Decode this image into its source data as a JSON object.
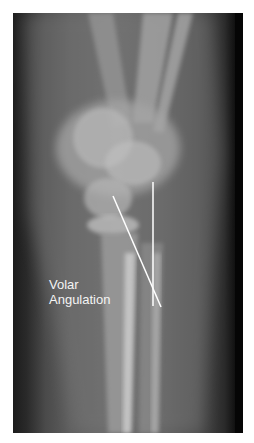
{
  "image": {
    "type": "radiograph",
    "subject": "lateral wrist x-ray",
    "annotation": {
      "label_lines": [
        "Volar",
        "Angulation"
      ],
      "label_color": "#f4f4f4",
      "line_color": "#ffffff"
    }
  }
}
